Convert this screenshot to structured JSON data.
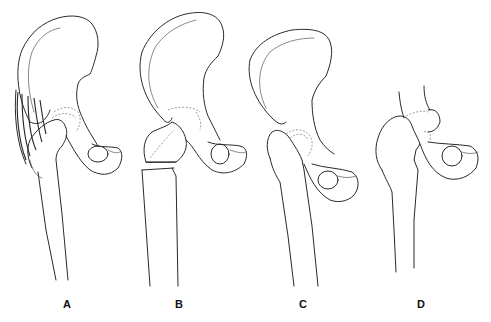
{
  "figure": {
    "panels": [
      {
        "id": "A",
        "label": "A",
        "content": "Pelvis with intact femur and gluteal muscle fibers spanning ilium to greater trochanter"
      },
      {
        "id": "B",
        "label": "B",
        "content": "Pelvis with femoral head/neck separated from shaft (transverse cut below neck)"
      },
      {
        "id": "C",
        "label": "C",
        "content": "Pelvis with proximal femur, femoral head dashed in acetabulum"
      },
      {
        "id": "D",
        "label": "D",
        "content": "Partial ilium with proximal femur displaced, acetabulum dashed"
      }
    ],
    "colors": {
      "line": "#2a2a2a",
      "background": "#ffffff"
    }
  }
}
